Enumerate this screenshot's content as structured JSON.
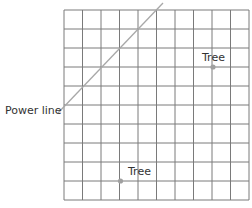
{
  "diagram": {
    "grid": {
      "columns": 10,
      "rows": 10,
      "line_color": "#7a7a7a"
    },
    "power_line": {
      "label": "Power line",
      "color": "#a8a8a8"
    },
    "trees": [
      {
        "label": "Tree",
        "col": 8,
        "row": 3
      },
      {
        "label": "Tree",
        "col": 3,
        "row": 9
      }
    ],
    "point_color": "#a0a0a0"
  }
}
